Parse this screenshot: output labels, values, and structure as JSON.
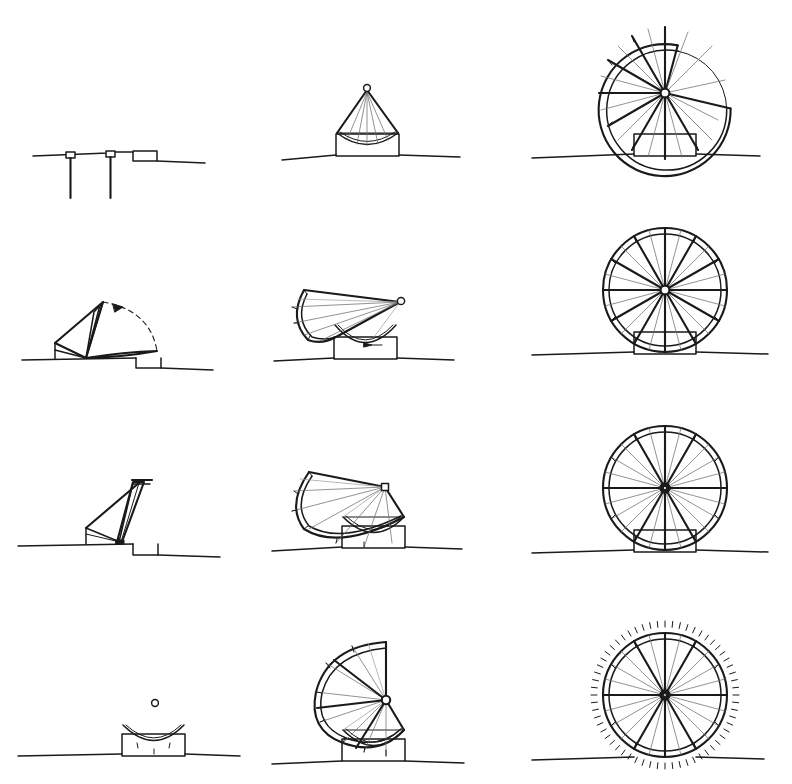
{
  "sheet": {
    "title": "Deployable Wheel Structure — Sequence Study",
    "description": "Hand-drawn technical sketch sheet: 4 rows by 3 columns of elevation drawings showing a folding segmented wheel deploying from a flat stowed state to a complete wheel.",
    "background_color": "#ffffff",
    "ink_color": "#1a1a1a",
    "faint_ink_color": "#6e6e6e",
    "width": 792,
    "height": 784,
    "rows": 4,
    "columns": 3
  },
  "panels": [
    {
      "id": "r1c1",
      "row": 1,
      "column": 1,
      "name": "stowed-flat-posts",
      "caption": "Stowed state — flat deck on two posts with step platform",
      "elements": [
        "ground-line",
        "post-left",
        "post-right",
        "post-cap-left",
        "post-cap-right",
        "step-box"
      ],
      "deploy_angle_deg": 0,
      "sector_opening_deg": 360
    },
    {
      "id": "r1c2",
      "row": 1,
      "column": 2,
      "name": "cone-closed-tent",
      "caption": "Folded cone — segments gathered to apex over curved cradle",
      "elements": [
        "ground-line",
        "base-box",
        "cradle-arc",
        "cone-outline",
        "apex-hub",
        "fold-lines"
      ],
      "deploy_angle_deg": 0,
      "sector_opening_deg": 300
    },
    {
      "id": "r1c3",
      "row": 1,
      "column": 3,
      "name": "wheel-open-sector-upper-right",
      "caption": "Partly deployed wheel — open sector to upper right",
      "elements": [
        "ground-line",
        "base-box",
        "double-rim",
        "hub",
        "spokes",
        "rim-ticks"
      ],
      "deploy_angle_deg": 270,
      "sector_opening_deg": 95
    },
    {
      "id": "r2c1",
      "row": 2,
      "column": 1,
      "name": "sail-raising-with-arc",
      "caption": "Raising motion — mast lifts, dashed arc with arrowhead shows rotation",
      "elements": [
        "ground-line",
        "step-box",
        "mast",
        "sail-panels",
        "dashed-motion-arc",
        "arrowhead"
      ],
      "deploy_angle_deg": 40,
      "sector_opening_deg": 300
    },
    {
      "id": "r2c2",
      "row": 2,
      "column": 2,
      "name": "quarter-fan-open-left",
      "caption": "Quarter fan opened to the left above curved cradle with direction arrow",
      "elements": [
        "ground-line",
        "base-box",
        "cradle-arc",
        "fan-sector",
        "hub-circle",
        "fold-lines",
        "direction-arrow"
      ],
      "deploy_angle_deg": 90,
      "sector_opening_deg": 270
    },
    {
      "id": "r2c3",
      "row": 2,
      "column": 3,
      "name": "wheel-complete-radial",
      "caption": "Complete wheel — double rim, twelve heavy spokes, faint intermediate spokes",
      "elements": [
        "ground-line",
        "base-box",
        "double-rim",
        "hub",
        "spokes",
        "rim-ticks"
      ],
      "deploy_angle_deg": 360,
      "sector_opening_deg": 0
    },
    {
      "id": "r3c1",
      "row": 3,
      "column": 1,
      "name": "mast-upright-step",
      "caption": "Mast near upright with flat head, braced off step",
      "elements": [
        "ground-line",
        "step-box",
        "mast",
        "brace-lines",
        "head-plate"
      ],
      "deploy_angle_deg": 75,
      "sector_opening_deg": 200
    },
    {
      "id": "r3c2",
      "row": 3,
      "column": 2,
      "name": "half-fan-tilted",
      "caption": "Half fan tilted, hub raised right, seated on cradle",
      "elements": [
        "ground-line",
        "base-box",
        "cradle-arc",
        "fan-sector",
        "hub-square",
        "fold-lines"
      ],
      "deploy_angle_deg": 180,
      "sector_opening_deg": 180
    },
    {
      "id": "r3c3",
      "row": 3,
      "column": 3,
      "name": "wheel-complete-dense-spokes",
      "caption": "Complete wheel — dense spoke set, horizontal and vertical heavy axes",
      "elements": [
        "ground-line",
        "base-box",
        "double-rim",
        "hub",
        "spokes",
        "rim-ticks"
      ],
      "deploy_angle_deg": 360,
      "sector_opening_deg": 0
    },
    {
      "id": "r4c1",
      "row": 4,
      "column": 1,
      "name": "cradle-empty-with-hub-dot",
      "caption": "Empty cradle on ground with free hub circle floating above",
      "elements": [
        "ground-line",
        "base-box",
        "cradle-arc",
        "hub-circle"
      ],
      "deploy_angle_deg": 0,
      "sector_opening_deg": 360
    },
    {
      "id": "r4c2",
      "row": 4,
      "column": 2,
      "name": "three-quarter-fan-open-left",
      "caption": "Three-quarter fan open to the left, gap at upper right",
      "elements": [
        "ground-line",
        "base-box",
        "cradle-arc",
        "fan-sector",
        "hub-circle",
        "fold-lines"
      ],
      "deploy_angle_deg": 270,
      "sector_opening_deg": 80
    },
    {
      "id": "r4c3",
      "row": 4,
      "column": 3,
      "name": "wheel-complete-with-cleats",
      "caption": "Complete wheel with dotted outer cleat ring around rim",
      "elements": [
        "ground-line",
        "base-box",
        "double-rim",
        "hub",
        "spokes",
        "rim-ticks",
        "outer-cleat-dots"
      ],
      "deploy_angle_deg": 360,
      "sector_opening_deg": 0
    }
  ],
  "geometry": {
    "wheel": {
      "outer_radius": 66,
      "inner_radius": 60,
      "hub_radius": 4.5,
      "heavy_spoke_count": 12,
      "faint_spoke_count": 24,
      "rim_tick_count": 24
    },
    "base_box": {
      "width": 62,
      "height": 22
    }
  }
}
